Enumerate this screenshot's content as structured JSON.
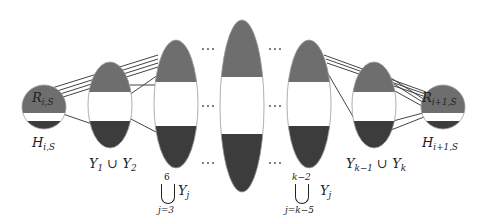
{
  "diagram": {
    "colors": {
      "top_fill": "#6e6e6e",
      "middle_fill": "#ffffff",
      "bottom_fill": "#3c3c3c",
      "outline": "#9a9a9a",
      "edge": "#444444",
      "text": "#222222"
    },
    "nodes": [
      {
        "id": "R_iS",
        "shape": "circle",
        "label_inside": "R",
        "label_inside_sub": "i,S",
        "label_below": "H",
        "label_below_sub": "i,S"
      },
      {
        "id": "Y1_Y2",
        "shape": "ellipse",
        "label_below": "Y",
        "label_below_text": "Y₁ ∪ Y₂"
      },
      {
        "id": "Union_3_6",
        "shape": "ellipse",
        "label_union_top": "6",
        "label_union_bottom": "j=3",
        "label_union_term": "Y",
        "label_union_term_sub": "j"
      },
      {
        "id": "Center",
        "shape": "ellipse"
      },
      {
        "id": "Union_k5_k2",
        "shape": "ellipse",
        "label_union_top": "k−2",
        "label_union_bottom": "j=k−5",
        "label_union_term": "Y",
        "label_union_term_sub": "j"
      },
      {
        "id": "Yk1_Yk",
        "shape": "ellipse",
        "label_below_text": "Yₖ₋₁ ∪ Yₖ"
      },
      {
        "id": "R_i1S",
        "shape": "circle",
        "label_inside": "R",
        "label_inside_sub": "i+1,S",
        "label_below": "H",
        "label_below_sub": "i+1,S"
      }
    ],
    "ellipsis": "···",
    "labels": {
      "R_left": "R",
      "R_left_sub": "i,S",
      "H_left": "H",
      "H_left_sub": "i,S",
      "Y1": "Y",
      "Y1_sub": "1",
      "cup": "∪",
      "Y2": "Y",
      "Y2_sub": "2",
      "union1_top": "6",
      "union1_bottom": "j=3",
      "union1_term": "Y",
      "union1_term_sub": "j",
      "union2_top": "k−2",
      "union2_bottom": "j=k−5",
      "union2_term": "Y",
      "union2_term_sub": "j",
      "Yk1": "Y",
      "Yk1_sub": "k−1",
      "Yk": "Y",
      "Yk_sub": "k",
      "R_right": "R",
      "R_right_sub": "i+1,S",
      "H_right": "H",
      "H_right_sub": "i+1,S"
    }
  }
}
